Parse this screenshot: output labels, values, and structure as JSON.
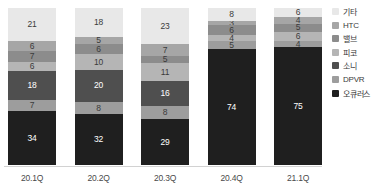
{
  "chart_data": {
    "type": "bar",
    "stacked": true,
    "title": "",
    "subtitle": "",
    "xlabel": "",
    "ylabel": "",
    "grid": false,
    "legend_position": "right",
    "ylim": [
      0,
      100
    ],
    "categories": [
      "20.1Q",
      "20.2Q",
      "20.3Q",
      "20.4Q",
      "21.1Q"
    ],
    "series": [
      {
        "name": "기타",
        "color": "#e8e8e8",
        "values": [
          21,
          18,
          23,
          8,
          6
        ]
      },
      {
        "name": "HTC",
        "color": "#a6a6a6",
        "values": [
          6,
          5,
          7,
          3,
          4
        ]
      },
      {
        "name": "밸브",
        "color": "#8c8c8c",
        "values": [
          7,
          6,
          5,
          6,
          5
        ]
      },
      {
        "name": "피코",
        "color": "#b5b5b5",
        "values": [
          6,
          10,
          11,
          4,
          6
        ]
      },
      {
        "name": "소니",
        "color": "#4f4f4f",
        "values": [
          18,
          20,
          16,
          0,
          0
        ]
      },
      {
        "name": "DPVR",
        "color": "#9d9d9d",
        "values": [
          7,
          8,
          8,
          5,
          4
        ]
      },
      {
        "name": "오큐러스",
        "color": "#1f1f1f",
        "values": [
          34,
          32,
          29,
          74,
          75
        ]
      }
    ]
  },
  "legend": {
    "items": [
      {
        "label": "기타"
      },
      {
        "label": "HTC"
      },
      {
        "label": "밸브"
      },
      {
        "label": "피코"
      },
      {
        "label": "소니"
      },
      {
        "label": "DPVR"
      },
      {
        "label": "오큐러스"
      }
    ]
  },
  "source": {
    "text": ""
  }
}
